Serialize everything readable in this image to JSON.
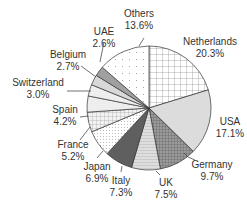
{
  "chart_data": {
    "type": "pie",
    "title": "",
    "start_angle_deg": 0,
    "direction": "clockwise",
    "categories": [
      "Netherlands",
      "USA",
      "Germany",
      "UK",
      "Italy",
      "Japan",
      "France",
      "Spain",
      "Switzerland",
      "Belgium",
      "UAE",
      "Others"
    ],
    "values": [
      20.3,
      17.1,
      9.7,
      7.5,
      7.3,
      6.9,
      5.2,
      4.2,
      3.0,
      2.7,
      2.6,
      13.6
    ],
    "labels": [
      {
        "name": "Netherlands",
        "value": "20.3%"
      },
      {
        "name": "USA",
        "value": "17.1%"
      },
      {
        "name": "Germany",
        "value": "9.7%"
      },
      {
        "name": "UK",
        "value": "7.5%"
      },
      {
        "name": "Italy",
        "value": "7.3%"
      },
      {
        "name": "Japan",
        "value": "6.9%"
      },
      {
        "name": "France",
        "value": "5.2%"
      },
      {
        "name": "Spain",
        "value": "4.2%"
      },
      {
        "name": "Switzerland",
        "value": "3.0%"
      },
      {
        "name": "Belgium",
        "value": "2.7%"
      },
      {
        "name": "UAE",
        "value": "2.6%"
      },
      {
        "name": "Others",
        "value": "13.6%"
      }
    ],
    "legend": "none",
    "grid": false
  },
  "layout": {
    "cx": 149,
    "cy": 108,
    "r": 62,
    "label_pos": [
      {
        "x": 210,
        "y": 45,
        "anchor": "middle"
      },
      {
        "x": 230,
        "y": 125,
        "anchor": "middle"
      },
      {
        "x": 212,
        "y": 168,
        "anchor": "middle"
      },
      {
        "x": 166,
        "y": 186,
        "anchor": "middle"
      },
      {
        "x": 121,
        "y": 184,
        "anchor": "middle"
      },
      {
        "x": 97,
        "y": 170,
        "anchor": "middle"
      },
      {
        "x": 73,
        "y": 148,
        "anchor": "middle"
      },
      {
        "x": 65,
        "y": 113,
        "anchor": "middle"
      },
      {
        "x": 38,
        "y": 86,
        "anchor": "middle"
      },
      {
        "x": 68,
        "y": 58,
        "anchor": "middle"
      },
      {
        "x": 104,
        "y": 35,
        "anchor": "middle"
      },
      {
        "x": 139,
        "y": 17,
        "anchor": "middle"
      }
    ],
    "leaders": [
      null,
      null,
      [
        [
          195,
          160
        ],
        [
          188,
          157
        ],
        [
          184,
          153
        ]
      ],
      [
        [
          160,
          175
        ],
        [
          156,
          171
        ]
      ],
      [
        [
          121,
          172
        ],
        [
          122,
          166
        ]
      ],
      [
        [
          97,
          158
        ],
        [
          103,
          151
        ]
      ],
      [
        [
          80,
          140
        ],
        [
          90,
          127
        ]
      ],
      [
        [
          80,
          117
        ],
        [
          88,
          116
        ]
      ],
      [
        [
          67,
          91
        ],
        [
          91,
          91
        ]
      ],
      [
        [
          81,
          66
        ],
        [
          96,
          77
        ]
      ],
      [
        [
          104,
          42
        ],
        [
          100,
          62
        ]
      ],
      [
        [
          144,
          38
        ],
        [
          139,
          46
        ]
      ]
    ],
    "fills": [
      "#ffffff",
      "#dcdcdc",
      "#8a8a8a",
      "#d2d2d2",
      "#6e6e6e",
      "#f3f3f3",
      "#e9e9e9",
      "#efefef",
      "#e2e2e2",
      "#d8d8d8",
      "#a0a0a0",
      "#fafafa"
    ],
    "patterns": [
      "grid-lg",
      "none",
      "crosshatch",
      "hlines",
      "crosshatch-dense",
      "dots-dense",
      "grid-sm",
      "dots-fine",
      "dots-fine",
      "none",
      "none",
      "dots-sparse"
    ]
  }
}
